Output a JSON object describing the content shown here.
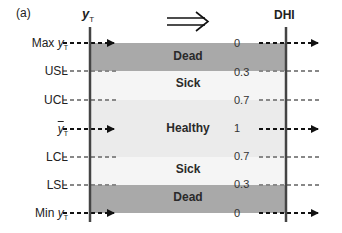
{
  "panel_label": "(a)",
  "left_axis": {
    "title_main": "y",
    "title_sub": "T"
  },
  "right_axis": {
    "title": "DHI"
  },
  "transform_arrow": "⟹",
  "rows": [
    {
      "key": "max",
      "label_main": "Max ",
      "label_var": "y",
      "label_sub": "T",
      "dhi": "0",
      "line": "arrow"
    },
    {
      "key": "usl",
      "label_main": "USL",
      "dhi": "0.3",
      "line": "dashed"
    },
    {
      "key": "ucl",
      "label_main": "UCL",
      "dhi": "0.7",
      "line": "dashed"
    },
    {
      "key": "mean",
      "label_var": "y",
      "label_bar": true,
      "label_sub": "T",
      "dhi": "1",
      "line": "arrow"
    },
    {
      "key": "lcl",
      "label_main": "LCL",
      "dhi": "0.7",
      "line": "dashed"
    },
    {
      "key": "lsl",
      "label_main": "LSL",
      "dhi": "0.3",
      "line": "dashed"
    },
    {
      "key": "min",
      "label_main": "Min ",
      "label_var": "y",
      "label_sub": "T",
      "dhi": "0",
      "line": "arrow"
    }
  ],
  "bands": [
    {
      "label": "Dead",
      "from": "Max yT",
      "to": "USL",
      "color": "#a9a9a9"
    },
    {
      "label": "Sick",
      "from": "USL",
      "to": "UCL",
      "color": "#f5f5f5"
    },
    {
      "label": "Healthy",
      "from": "UCL",
      "to": "LCL",
      "color": "#ebebeb"
    },
    {
      "label": "Sick",
      "from": "LCL",
      "to": "LSL",
      "color": "#f5f5f5"
    },
    {
      "label": "Dead",
      "from": "LSL",
      "to": "Min yT",
      "color": "#a9a9a9"
    }
  ],
  "colors": {
    "axis": "#444444",
    "arrow_dash": "#111111",
    "limit_dash": "#888888"
  }
}
